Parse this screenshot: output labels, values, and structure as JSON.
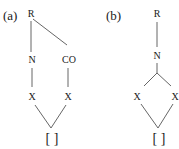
{
  "diagrams": [
    {
      "label": "(a)",
      "nodes": {
        "root": "R",
        "left": "N",
        "right": "CO",
        "left_x": "X",
        "right_x": "X",
        "bottom": "[ ]"
      }
    },
    {
      "label": "(b)",
      "nodes": {
        "root": "R",
        "mid": "N",
        "left_x": "X",
        "right_x": "X",
        "bottom": "[ ]"
      }
    }
  ],
  "colors": {
    "text": "#1a1a1a",
    "line": "#555555",
    "background": "#ffffff"
  }
}
